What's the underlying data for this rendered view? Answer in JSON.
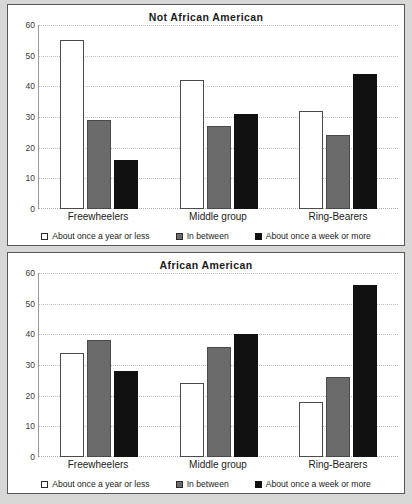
{
  "chart_data": [
    {
      "type": "bar",
      "title": "Not African American",
      "xlabel": "",
      "ylabel": "",
      "ylim": [
        0,
        60
      ],
      "yticks": [
        0,
        10,
        20,
        30,
        40,
        50,
        60
      ],
      "grid": true,
      "legend_position": "bottom",
      "categories": [
        "Freewheelers",
        "Middle group",
        "Ring-Bearers"
      ],
      "series": [
        {
          "name": "About once a year or less",
          "color": "#ffffff",
          "values": [
            55,
            42,
            32
          ]
        },
        {
          "name": "In between",
          "color": "#6b6b6b",
          "values": [
            29,
            27,
            24
          ]
        },
        {
          "name": "About once a week or more",
          "color": "#111111",
          "values": [
            16,
            31,
            44
          ]
        }
      ]
    },
    {
      "type": "bar",
      "title": "African American",
      "xlabel": "",
      "ylabel": "",
      "ylim": [
        0,
        60
      ],
      "yticks": [
        0,
        10,
        20,
        30,
        40,
        50,
        60
      ],
      "grid": true,
      "legend_position": "bottom",
      "categories": [
        "Freewheelers",
        "Middle group",
        "Ring-Bearers"
      ],
      "series": [
        {
          "name": "About once a year or less",
          "color": "#ffffff",
          "values": [
            34,
            24,
            18
          ]
        },
        {
          "name": "In between",
          "color": "#6b6b6b",
          "values": [
            38,
            36,
            26
          ]
        },
        {
          "name": "About once a week or more",
          "color": "#111111",
          "values": [
            28,
            40,
            56
          ]
        }
      ]
    }
  ]
}
